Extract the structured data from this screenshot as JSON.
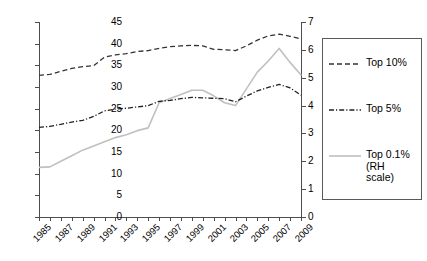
{
  "chart_data": {
    "type": "line",
    "title": "",
    "subtitle": "",
    "xlabel": "",
    "ylabel": "",
    "y2label": "",
    "x": [
      1985,
      1986,
      1987,
      1988,
      1989,
      1990,
      1991,
      1992,
      1993,
      1994,
      1995,
      1996,
      1997,
      1998,
      1999,
      2000,
      2001,
      2002,
      2003,
      2004,
      2005,
      2006,
      2007,
      2008,
      2009
    ],
    "xlim": [
      1985,
      2009
    ],
    "xtick_step": 1,
    "xtick_label_step": 2,
    "xtick_labels": [
      "1985",
      "1987",
      "1989",
      "1991",
      "1993",
      "1995",
      "1997",
      "1999",
      "2001",
      "2003",
      "2005",
      "2007",
      "2009"
    ],
    "xtick_label_rotation": -45,
    "ylim": [
      0,
      45
    ],
    "yticks": [
      0,
      5,
      10,
      15,
      20,
      25,
      30,
      35,
      40,
      45
    ],
    "ytick_labels": [
      "0",
      "5",
      "10",
      "15",
      "20",
      "25",
      "30",
      "35",
      "40",
      "45"
    ],
    "y2lim": [
      0,
      7
    ],
    "y2ticks": [
      0,
      1,
      2,
      3,
      4,
      5,
      6,
      7
    ],
    "y2tick_labels": [
      "0",
      "1",
      "2",
      "3",
      "4",
      "5",
      "6",
      "7"
    ],
    "grid": false,
    "legend_position": "right",
    "series": [
      {
        "name": "Top 10%",
        "axis": "left",
        "style": "dashed",
        "color": "#333333",
        "values": [
          32.7,
          32.9,
          33.6,
          34.3,
          34.7,
          34.9,
          36.9,
          37.4,
          37.7,
          38.2,
          38.4,
          38.9,
          39.3,
          39.5,
          39.6,
          39.5,
          38.7,
          38.6,
          38.4,
          39.5,
          40.8,
          41.8,
          42.2,
          41.7,
          41.1
        ]
      },
      {
        "name": "Top 5%",
        "axis": "left",
        "style": "dash-dot",
        "color": "#222222",
        "values": [
          20.7,
          20.9,
          21.4,
          21.9,
          22.3,
          23.2,
          24.5,
          24.9,
          25.1,
          25.4,
          25.7,
          26.7,
          26.9,
          27.3,
          27.6,
          27.5,
          27.4,
          27.3,
          26.6,
          27.9,
          29.1,
          29.9,
          30.6,
          29.8,
          28.1
        ]
      },
      {
        "name": "Top 0.1% (RH scale)",
        "axis": "right",
        "style": "solid",
        "color": "#c0c0c0",
        "values": [
          1.78,
          1.8,
          2.0,
          2.2,
          2.4,
          2.55,
          2.7,
          2.85,
          2.95,
          3.1,
          3.2,
          4.1,
          4.25,
          4.4,
          4.55,
          4.55,
          4.35,
          4.1,
          4.0,
          4.6,
          5.2,
          5.6,
          6.05,
          5.55,
          5.1
        ]
      }
    ]
  },
  "legend": {
    "entries": [
      {
        "label": "Top 10%",
        "style": "dashed",
        "color": "#333333"
      },
      {
        "label": "Top 5%",
        "style": "dash-dot",
        "color": "#222222"
      },
      {
        "label": "Top 0.1%\n(RH\nscale)",
        "style": "solid",
        "color": "#c0c0c0"
      }
    ],
    "entry0_label": "Top 10%",
    "entry1_label": "Top 5%",
    "entry2_line1": "Top 0.1%",
    "entry2_line2": "(RH",
    "entry2_line3": "scale)"
  },
  "axis": {
    "left_labels": [
      "45",
      "40",
      "35",
      "30",
      "25",
      "20",
      "15",
      "10",
      "5",
      "0"
    ],
    "right_labels": [
      "7",
      "6",
      "5",
      "4",
      "3",
      "2",
      "1",
      "0"
    ],
    "x_labels": [
      "1985",
      "1987",
      "1989",
      "1991",
      "1993",
      "1995",
      "1997",
      "1999",
      "2001",
      "2003",
      "2005",
      "2007",
      "2009"
    ]
  }
}
